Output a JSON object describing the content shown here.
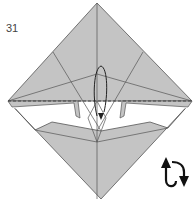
{
  "diagram": {
    "step_number": "31",
    "paper_color": "#c4c4c4",
    "line_color": "#555555",
    "symbols": [
      "fold-behind-arrow",
      "valley-fold-dashed-line",
      "turn-over-icon"
    ],
    "turn_over_symbol": "turn-over-icon"
  }
}
